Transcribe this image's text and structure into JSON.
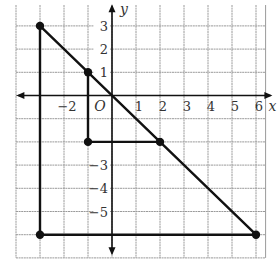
{
  "chart_data": {
    "type": "line",
    "title": "",
    "xlabel": "x",
    "ylabel": "y",
    "origin_label": "O",
    "xlim": [
      -4,
      7
    ],
    "ylim": [
      -7,
      4
    ],
    "grid": true,
    "x_tick_labels": [
      "−2",
      "1",
      "2",
      "3",
      "4",
      "5",
      "6"
    ],
    "x_ticks": [
      -2,
      1,
      2,
      3,
      4,
      5,
      6
    ],
    "y_tick_labels": [
      "3",
      "2",
      "1",
      "−3",
      "−4",
      "−5"
    ],
    "y_ticks": [
      3,
      2,
      1,
      -3,
      -4,
      -5
    ],
    "points": [
      {
        "x": -3,
        "y": 3
      },
      {
        "x": -1,
        "y": 1
      },
      {
        "x": 2,
        "y": -2
      },
      {
        "x": 6,
        "y": -6
      },
      {
        "x": -1,
        "y": -2
      },
      {
        "x": -3,
        "y": -6
      }
    ],
    "series": [
      {
        "name": "diagonal line y = -x",
        "values": [
          [
            -3,
            3
          ],
          [
            6,
            -6
          ]
        ]
      },
      {
        "name": "large triangle vertical leg",
        "values": [
          [
            -3,
            3
          ],
          [
            -3,
            -6
          ]
        ]
      },
      {
        "name": "large triangle horizontal leg",
        "values": [
          [
            -3,
            -6
          ],
          [
            6,
            -6
          ]
        ]
      },
      {
        "name": "small triangle vertical leg",
        "values": [
          [
            -1,
            1
          ],
          [
            -1,
            -2
          ]
        ]
      },
      {
        "name": "small triangle horizontal leg",
        "values": [
          [
            -1,
            -2
          ],
          [
            2,
            -2
          ]
        ]
      }
    ],
    "colors": {
      "line": "#111111",
      "grid": "#9a9a9a",
      "axis": "#111111"
    }
  }
}
